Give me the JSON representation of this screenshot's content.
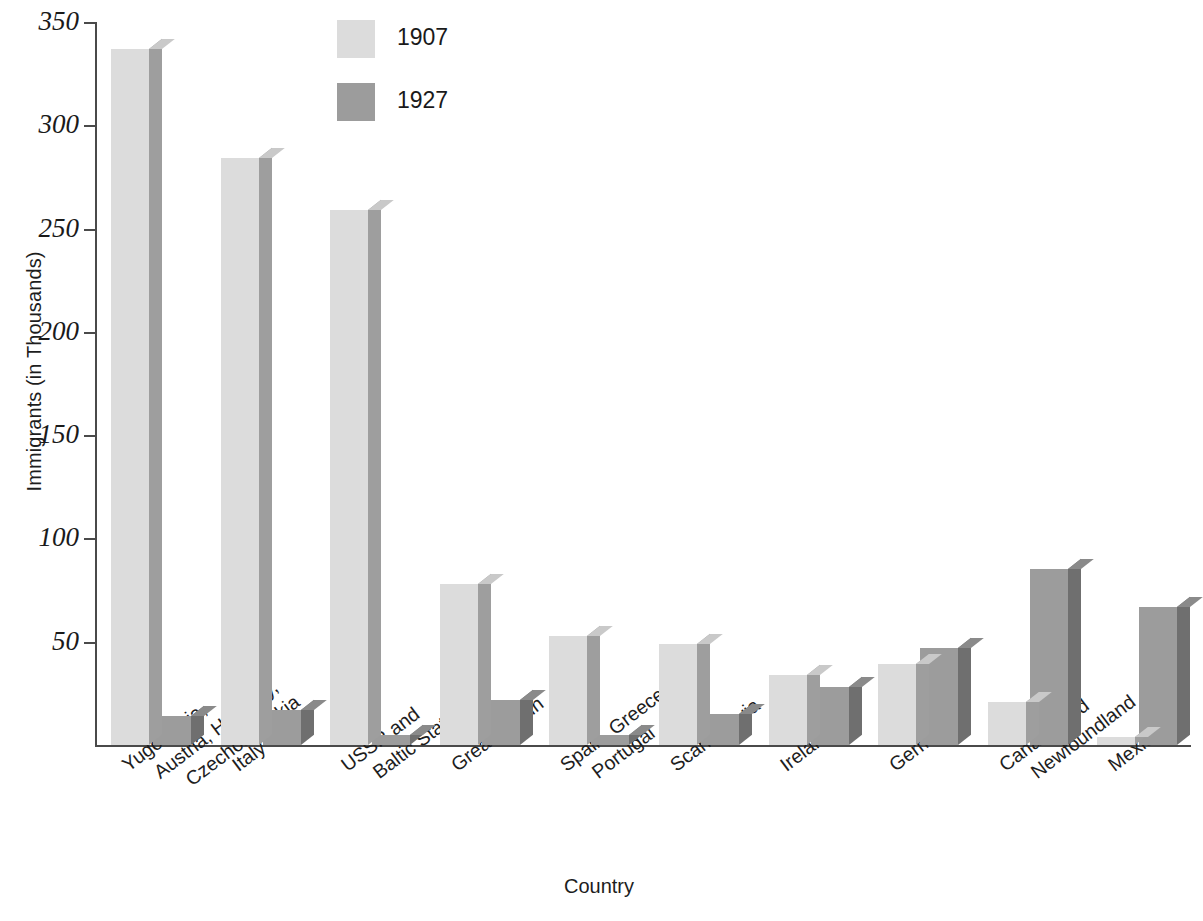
{
  "chart_data": {
    "type": "bar",
    "title": "",
    "xlabel": "Country",
    "ylabel": "Immigrants (in Thousands)",
    "ylim": [
      0,
      350
    ],
    "yticks": [
      0,
      50,
      100,
      150,
      200,
      250,
      300,
      350
    ],
    "ytick_labels": [
      "50",
      "100",
      "150",
      "200",
      "250",
      "300",
      "350"
    ],
    "grid": false,
    "legend_position": "top-center",
    "categories": [
      "Yugoslavia, Austria, Hungary, Czechoslovakia",
      "Italy",
      "USSR and Baltic States",
      "Great Britain",
      "Spain, Greece, Portugal",
      "Scandinavia",
      "Ireland",
      "Germany",
      "Canada and Newfoundland",
      "Mexico"
    ],
    "category_lines": [
      [
        "Yugoslavia,",
        "Austria, Hungary,",
        "Czechoslovakia"
      ],
      [
        "Italy"
      ],
      [
        "USSR and",
        "Baltic States"
      ],
      [
        "Great Britain"
      ],
      [
        "Spain, Greece,",
        "Portugal"
      ],
      [
        "Scandinavia"
      ],
      [
        "Ireland"
      ],
      [
        "Germany"
      ],
      [
        "Canada and",
        "Newfoundland"
      ],
      [
        "Mexico"
      ]
    ],
    "series": [
      {
        "name": "1907",
        "color": "#dcdcdc",
        "values": [
          337,
          284,
          259,
          78,
          53,
          49,
          34,
          39,
          21,
          4
        ]
      },
      {
        "name": "1927",
        "color": "#9c9c9c",
        "values": [
          14,
          17,
          5,
          22,
          5,
          15,
          28,
          47,
          85,
          67
        ]
      }
    ]
  },
  "legend": {
    "items": [
      {
        "label": "1907",
        "swatch": "light-gray-swatch"
      },
      {
        "label": "1927",
        "swatch": "medium-gray-swatch"
      }
    ]
  },
  "axes": {
    "x_title": "Country",
    "y_title": "Immigrants (in Thousands)"
  },
  "colors": {
    "series_1907_face": "#dcdcdc",
    "series_1907_side": "#9e9e9e",
    "series_1927_face": "#9c9c9c",
    "series_1927_side": "#6f6f6f",
    "axis": "#4a4a4a",
    "text": "#1a1a1a",
    "background": "#ffffff"
  },
  "caption": {
    "remnant": ""
  }
}
